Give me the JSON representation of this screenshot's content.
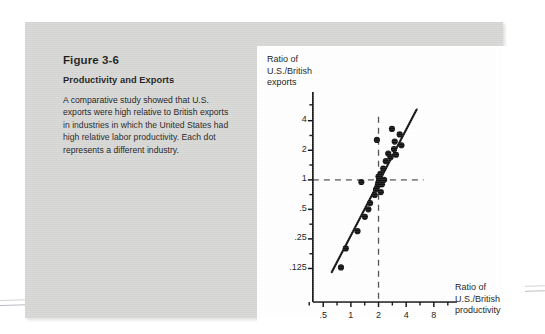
{
  "figure": {
    "number": "Figure 3-6",
    "subtitle": "Productivity and Exports",
    "body": "A comparative study showed that U.S. exports were high relative to British exports in industries in which the United States had high relative labor productivity. Each dot represents a different industry."
  },
  "chart_data": {
    "type": "scatter",
    "title": "",
    "ylabel": "Ratio of\nU.S./British\nexports",
    "xlabel": "Ratio of\nU.S./British\nproductivity",
    "xscale": "log",
    "yscale": "log",
    "xlim": [
      0.35,
      12
    ],
    "ylim": [
      0.1,
      6.5
    ],
    "grid": false,
    "legend": null,
    "x_tick_labels": [
      ".5",
      "1",
      "2",
      "4",
      "8"
    ],
    "x_tick_values": [
      0.5,
      1,
      2,
      4,
      8
    ],
    "y_tick_labels": [
      "4",
      "2",
      "1",
      ".5",
      ".25",
      ".125"
    ],
    "y_tick_values": [
      4,
      2,
      1,
      0.5,
      0.25,
      0.125
    ],
    "reference_lines": [
      {
        "orientation": "horizontal",
        "value": 1,
        "style": "dashed"
      },
      {
        "orientation": "vertical",
        "value": 2,
        "style": "dashed"
      }
    ],
    "trend_line": {
      "style": "solid",
      "x_start": 0.62,
      "y_start": 0.115,
      "x_end": 5.2,
      "y_end": 5.2
    },
    "points": [
      {
        "x": 0.78,
        "y": 0.128
      },
      {
        "x": 0.88,
        "y": 0.2
      },
      {
        "x": 1.18,
        "y": 0.3
      },
      {
        "x": 1.42,
        "y": 0.42
      },
      {
        "x": 1.55,
        "y": 0.5
      },
      {
        "x": 1.62,
        "y": 0.58
      },
      {
        "x": 1.3,
        "y": 0.95
      },
      {
        "x": 1.82,
        "y": 0.7
      },
      {
        "x": 1.88,
        "y": 0.8
      },
      {
        "x": 1.95,
        "y": 0.86
      },
      {
        "x": 1.98,
        "y": 0.92
      },
      {
        "x": 2.02,
        "y": 0.98
      },
      {
        "x": 2.06,
        "y": 1.02
      },
      {
        "x": 2.0,
        "y": 1.08
      },
      {
        "x": 2.1,
        "y": 1.15
      },
      {
        "x": 2.18,
        "y": 0.9
      },
      {
        "x": 2.3,
        "y": 1.0
      },
      {
        "x": 2.12,
        "y": 0.75
      },
      {
        "x": 2.25,
        "y": 1.3
      },
      {
        "x": 2.4,
        "y": 1.55
      },
      {
        "x": 2.55,
        "y": 1.85
      },
      {
        "x": 1.92,
        "y": 2.55
      },
      {
        "x": 2.7,
        "y": 1.7
      },
      {
        "x": 3.1,
        "y": 1.8
      },
      {
        "x": 2.95,
        "y": 2.05
      },
      {
        "x": 3.0,
        "y": 2.45
      },
      {
        "x": 3.55,
        "y": 2.25
      },
      {
        "x": 3.4,
        "y": 2.9
      },
      {
        "x": 2.8,
        "y": 3.3
      }
    ]
  }
}
